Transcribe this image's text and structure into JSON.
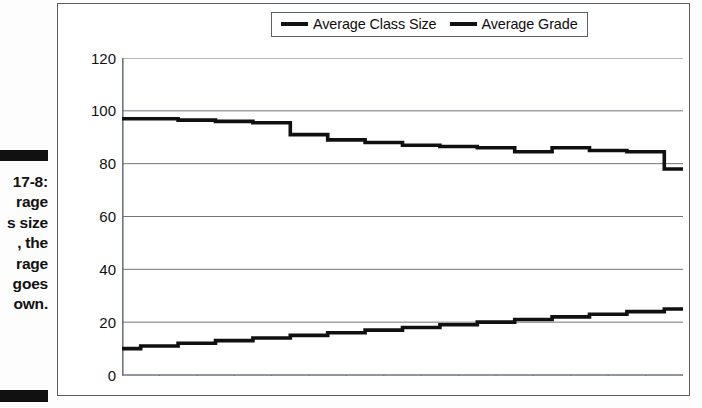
{
  "figure": {
    "caption_lines": [
      "17-8:",
      "rage",
      "s size",
      ", the",
      "rage",
      "goes",
      "own."
    ],
    "bar_color": "#111111"
  },
  "legend": {
    "position": "top-center",
    "items": [
      {
        "label": "Average Class Size",
        "color": "#101010",
        "icon": "line-swatch-icon"
      },
      {
        "label": "Average Grade",
        "color": "#101010",
        "icon": "line-swatch-icon"
      }
    ]
  },
  "axes": {
    "y_ticks": [
      "120",
      "100",
      "80",
      "60",
      "40",
      "20",
      "0"
    ],
    "x_tick_count": 16,
    "x_tick_labels": []
  },
  "colors": {
    "frame": "#555c63",
    "gridline": "#6e757c",
    "series": "#101010",
    "background": "#ffffff"
  },
  "chart_data": {
    "type": "line",
    "title": "",
    "subtitle": "",
    "xlabel": "",
    "ylabel": "",
    "ylim": [
      0,
      120
    ],
    "ytick_step": 20,
    "grid": true,
    "legend_position": "top-center",
    "x": [
      1,
      2,
      3,
      4,
      5,
      6,
      7,
      8,
      9,
      10,
      11,
      12,
      13,
      14,
      15,
      16
    ],
    "series": [
      {
        "name": "Average Class Size",
        "color": "#101010",
        "values": [
          97,
          97,
          96.5,
          96,
          95.5,
          91,
          89,
          88,
          87,
          86.5,
          86,
          84.5,
          86,
          85,
          84.5,
          78
        ]
      },
      {
        "name": "Average Grade",
        "color": "#101010",
        "values": [
          10,
          11,
          12,
          13,
          14,
          15,
          16,
          17,
          18,
          19,
          20,
          21,
          22,
          23,
          24,
          25
        ]
      }
    ]
  }
}
